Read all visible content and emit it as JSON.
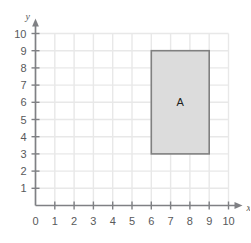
{
  "chart_data": {
    "type": "scatter",
    "title": "",
    "xlabel": "x",
    "ylabel": "y",
    "xlim": [
      0,
      10
    ],
    "ylim": [
      0,
      10
    ],
    "grid": true,
    "legend": "none",
    "x_ticks": [
      "0",
      "1",
      "2",
      "3",
      "4",
      "5",
      "6",
      "7",
      "8",
      "9",
      "10"
    ],
    "y_ticks": [
      "0",
      "1",
      "2",
      "3",
      "4",
      "5",
      "6",
      "7",
      "8",
      "9",
      "10"
    ],
    "x_tick_values": [
      0,
      1,
      2,
      3,
      4,
      5,
      6,
      7,
      8,
      9,
      10
    ],
    "y_tick_values": [
      0,
      1,
      2,
      3,
      4,
      5,
      6,
      7,
      8,
      9,
      10
    ],
    "origin_label": "0",
    "shapes": [
      {
        "label": "A",
        "type": "rectangle",
        "x_min": 6,
        "x_max": 9,
        "y_min": 3,
        "y_max": 9,
        "width": 3,
        "height": 6,
        "label_x": 7.5,
        "label_y": 6,
        "fill": "#dcdcdc",
        "stroke": "#808080"
      }
    ],
    "colors": {
      "background": "#ffffff",
      "grid_line": "#e8e8e8",
      "axis_line": "#7f8084",
      "tick_text": "#58595b",
      "shape_fill": "#dcdcdc",
      "shape_stroke": "#808080",
      "shape_label": "#231f20"
    }
  }
}
